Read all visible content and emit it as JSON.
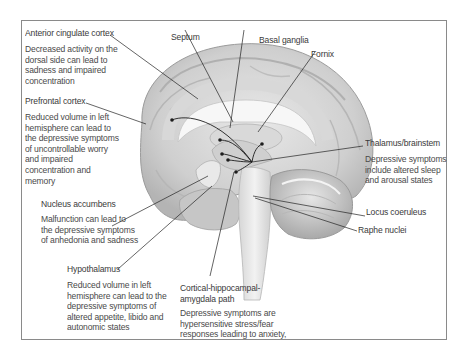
{
  "figure": {
    "type": "annotated anatomical illustration"
  },
  "labels": {
    "acc": {
      "name": "Anterior cingulate cortex",
      "desc": [
        "Decreased activity on the",
        "dorsal side can lead to",
        "sadness and impaired",
        "concentration"
      ]
    },
    "pfc": {
      "name": "Prefrontal cortex",
      "desc": [
        "Reduced volume in left",
        "hemisphere can lead to",
        "the depressive symptoms",
        "of uncontrollable worry",
        "and impaired",
        "concentration and",
        "memory"
      ]
    },
    "nac": {
      "name": "Nucleus accumbens",
      "desc": [
        "Malfunction can lead to",
        "the depressive symptoms",
        "of anhedonia and sadness"
      ]
    },
    "hypo": {
      "name": "Hypothalamus",
      "desc": [
        "Reduced volume in left",
        "hemisphere can lead to the",
        "depressive symptoms of",
        "altered appetite, libido and",
        "autonomic states"
      ]
    },
    "cha": {
      "name": [
        "Cortical-hippocampal-",
        "amygdala path"
      ],
      "desc": [
        "Depressive symptoms are",
        "hypersensitive stress/fear",
        "responses leading to anxiety,"
      ]
    },
    "septum": {
      "name": "Septum"
    },
    "basal": {
      "name": "Basal ganglia"
    },
    "fornix": {
      "name": "Fornix"
    },
    "thal": {
      "name": "Thalamus/brainstem",
      "desc": [
        "Depressive symptoms",
        "include altered sleep",
        "and arousal states"
      ]
    },
    "lc": {
      "name": "Locus coeruleus"
    },
    "raphe": {
      "name": "Raphe nuclei"
    }
  },
  "colors": {
    "frame": "#8a8a8a",
    "text": "#3a3a3a",
    "brain_light": "#e4e4e4",
    "brain_mid": "#c9c9c9",
    "brain_dark": "#a8a8a8",
    "leader_line": "#222222"
  }
}
